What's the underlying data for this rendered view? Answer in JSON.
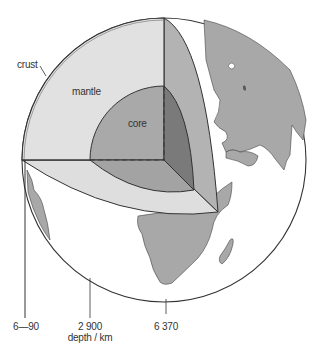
{
  "diagram": {
    "type": "earth-cutaway-structure",
    "layers": [
      {
        "name": "crust",
        "label": "crust",
        "color": "#d9d9d9"
      },
      {
        "name": "mantle",
        "label": "mantle",
        "color": "#dcdcdc"
      },
      {
        "name": "core",
        "label": "core",
        "color": "#a9a9a9"
      }
    ],
    "colors": {
      "ocean": "#ffffff",
      "land": "#a6a6a6",
      "mantle_face": "#dedede",
      "mantle_side": "#b3b3b3",
      "core_face": "#a8a8a8",
      "core_side": "#7a7a7a",
      "outline": "#333333"
    },
    "depth_scale": {
      "ticks": [
        {
          "label": "6—90"
        },
        {
          "label": "2 900"
        },
        {
          "label": "6 370"
        }
      ],
      "axis_label": "depth / km"
    }
  }
}
